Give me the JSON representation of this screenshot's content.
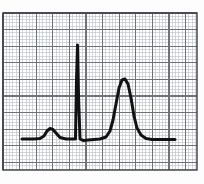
{
  "figure": {
    "title": "",
    "caption": "",
    "background_color": "#fdfdfd"
  },
  "grid_paper": {
    "name": "ecg-graph-paper",
    "minor_color": "#b9bcc2",
    "major_color": "#6e7279",
    "border_color": "#3a3c40",
    "minor_spacing_px": 3.32,
    "major_every": 5,
    "plot_left_px": 3,
    "plot_top_px": 13,
    "plot_right_px": 197,
    "plot_bottom_px": 170
  },
  "trace": {
    "name": "ecg-waveform",
    "color": "#111111",
    "line_width_px": 3.0,
    "baseline_y_px": 139
  },
  "chart_data": {
    "type": "line",
    "title": "",
    "subtitle": "",
    "xlabel": "",
    "ylabel": "",
    "xlim": [
      0,
      204
    ],
    "ylim": [
      184,
      0
    ],
    "grid": true,
    "legend_position": "none",
    "series": [
      {
        "name": "ecg-trace",
        "color": "#111111",
        "x": [
          22,
          28,
          34,
          40,
          44,
          47,
          50,
          53,
          56,
          60,
          66,
          72,
          75.5,
          76.5,
          77.5,
          78.5,
          80,
          82,
          84,
          88,
          94,
          100,
          106,
          110,
          113,
          116,
          119,
          122,
          125,
          128,
          131,
          134,
          137,
          141,
          146,
          152,
          160,
          168,
          175
        ],
        "y": [
          139,
          139,
          139,
          138.5,
          136,
          131,
          128.5,
          129.5,
          133,
          137.5,
          139,
          139,
          139,
          80,
          45,
          95,
          139,
          140,
          140.5,
          140,
          139.5,
          139,
          137,
          131,
          120,
          104,
          88,
          80,
          79,
          84,
          98,
          116,
          128,
          135,
          138.5,
          139.5,
          139.5,
          139.5,
          139.5
        ]
      }
    ],
    "annotations": [
      {
        "name": "p-wave",
        "x": 50,
        "y": 128.5,
        "label": ""
      },
      {
        "name": "r-spike",
        "x": 77.5,
        "y": 45,
        "label": ""
      },
      {
        "name": "t-wave",
        "x": 123,
        "y": 79,
        "label": ""
      }
    ]
  }
}
